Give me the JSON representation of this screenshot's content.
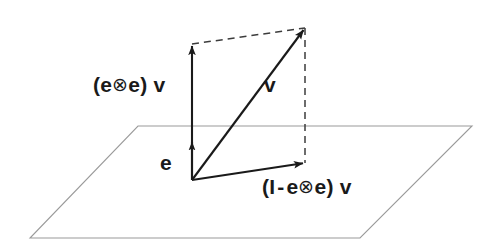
{
  "figure": {
    "background_color": "#ffffff",
    "stroke_color": "#1a1a1a",
    "plane_color": "#9a9a9a",
    "dash_color": "#4a4a4a"
  },
  "labels": {
    "projection_parallel": "(e⊗e) v",
    "projection_parallel_parts": {
      "open_paren": "(",
      "e_first": "e",
      "tensor": "⊗",
      "e_second": "e",
      "close_paren": ")",
      "v": "v"
    },
    "vector_v": "v",
    "unit_vector_e": "e",
    "projection_perpendicular": "(I - e⊗e) v",
    "projection_perpendicular_parts": {
      "open_paren": "(",
      "identity": "I",
      "minus": "-",
      "e_first": "e",
      "tensor": "⊗",
      "e_second": "e",
      "close_paren": ")",
      "v": "v"
    }
  },
  "geometry": {
    "origin": {
      "x": 192,
      "y": 180
    },
    "plane_corners": [
      {
        "x": 138,
        "y": 126
      },
      {
        "x": 472,
        "y": 126
      },
      {
        "x": 360,
        "y": 238
      },
      {
        "x": 30,
        "y": 238
      }
    ],
    "vectors": [
      {
        "name": "e",
        "from": {
          "x": 192,
          "y": 180
        },
        "to": {
          "x": 192,
          "y": 140
        },
        "style": "solid"
      },
      {
        "name": "projection-parallel",
        "from": {
          "x": 192,
          "y": 180
        },
        "to": {
          "x": 192,
          "y": 44
        },
        "style": "solid"
      },
      {
        "name": "v",
        "from": {
          "x": 192,
          "y": 180
        },
        "to": {
          "x": 305,
          "y": 28
        },
        "style": "solid"
      },
      {
        "name": "projection-perpendicular",
        "from": {
          "x": 192,
          "y": 180
        },
        "to": {
          "x": 305,
          "y": 163
        },
        "style": "solid"
      }
    ],
    "dashed_lines": [
      {
        "name": "parallelogram-top",
        "from": {
          "x": 192,
          "y": 44
        },
        "to": {
          "x": 305,
          "y": 28
        }
      },
      {
        "name": "parallelogram-right",
        "from": {
          "x": 305,
          "y": 28
        },
        "to": {
          "x": 305,
          "y": 163
        }
      }
    ]
  }
}
